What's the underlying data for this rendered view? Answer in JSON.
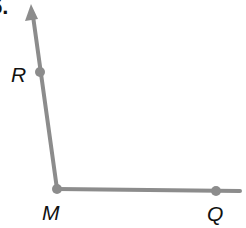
{
  "problem_number": "5.",
  "figure": {
    "type": "angle",
    "vertex": "M",
    "rays": [
      "MR",
      "MQ"
    ],
    "color": "#8c8c8c"
  },
  "labels": {
    "R": "R",
    "M": "M",
    "Q": "Q"
  }
}
